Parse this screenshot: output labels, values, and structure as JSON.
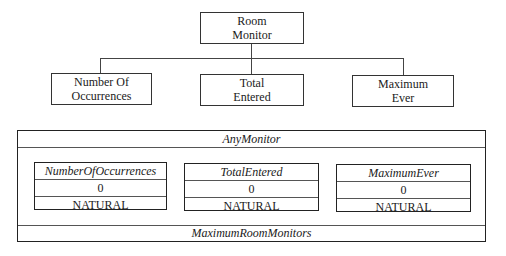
{
  "tree": {
    "root": {
      "line1": "Room",
      "line2": "Monitor"
    },
    "children": [
      {
        "line1": "Number Of",
        "line2": "Occurrences"
      },
      {
        "line1": "Total",
        "line2": "Entered"
      },
      {
        "line1": "Maximum",
        "line2": "Ever"
      }
    ]
  },
  "component": {
    "title": "AnyMonitor",
    "footer": "MaximumRoomMonitors",
    "attributes": [
      {
        "name": "NumberOfOccurrences",
        "value": "0",
        "type": "NATURAL"
      },
      {
        "name": "TotalEntered",
        "value": "0",
        "type": "NATURAL"
      },
      {
        "name": "MaximumEver",
        "value": "0",
        "type": "NATURAL"
      }
    ]
  }
}
